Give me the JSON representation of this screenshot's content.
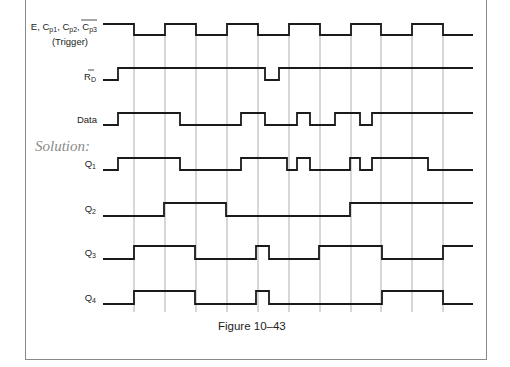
{
  "figure": {
    "caption": "Figure 10–43",
    "solution_label": "Solution:",
    "grid_lines_x": [
      134,
      165,
      196,
      227,
      258,
      289,
      320,
      351,
      381,
      412,
      443
    ],
    "x_start": 103,
    "x_end": 473
  },
  "signals": [
    {
      "name": "trigger",
      "label_line1": "E, C",
      "label_parts": [
        "E, C",
        "p1",
        ", C",
        "p2",
        ", C",
        "p3"
      ],
      "label_line2": "(Trigger)",
      "y_high": 24,
      "y_low": 35,
      "points": [
        [
          103,
          "H"
        ],
        [
          134,
          "L"
        ],
        [
          165,
          "H"
        ],
        [
          196,
          "L"
        ],
        [
          227,
          "H"
        ],
        [
          258,
          "L"
        ],
        [
          289,
          "H"
        ],
        [
          320,
          "L"
        ],
        [
          351,
          "H"
        ],
        [
          381,
          "L"
        ],
        [
          412,
          "H"
        ],
        [
          443,
          "L"
        ],
        [
          473,
          "L"
        ]
      ]
    },
    {
      "name": "reset",
      "label": "R",
      "label_sub": "D",
      "y_high": 68,
      "y_low": 80,
      "points": [
        [
          103,
          "L"
        ],
        [
          118,
          "H"
        ],
        [
          265,
          "L"
        ],
        [
          279,
          "H"
        ],
        [
          473,
          "H"
        ]
      ]
    },
    {
      "name": "data",
      "label": "Data",
      "y_high": 113,
      "y_low": 125,
      "points": [
        [
          103,
          "L"
        ],
        [
          118,
          "H"
        ],
        [
          180,
          "L"
        ],
        [
          241,
          "H"
        ],
        [
          265,
          "L"
        ],
        [
          297,
          "H"
        ],
        [
          310,
          "L"
        ],
        [
          335,
          "H"
        ],
        [
          360,
          "L"
        ],
        [
          372,
          "H"
        ],
        [
          473,
          "H"
        ]
      ]
    },
    {
      "name": "q1",
      "label": "Q",
      "label_sub": "1",
      "y_high": 158,
      "y_low": 170,
      "points": [
        [
          103,
          "L"
        ],
        [
          118,
          "H"
        ],
        [
          180,
          "L"
        ],
        [
          241,
          "H"
        ],
        [
          287,
          "L"
        ],
        [
          297,
          "H"
        ],
        [
          310,
          "L"
        ],
        [
          350,
          "H"
        ],
        [
          360,
          "L"
        ],
        [
          372,
          "H"
        ],
        [
          428,
          "L"
        ],
        [
          473,
          "L"
        ]
      ]
    },
    {
      "name": "q2",
      "label": "Q",
      "label_sub": "2",
      "y_high": 203,
      "y_low": 216,
      "points": [
        [
          103,
          "L"
        ],
        [
          164,
          "H"
        ],
        [
          226,
          "L"
        ],
        [
          350,
          "H"
        ],
        [
          473,
          "H"
        ]
      ]
    },
    {
      "name": "q3",
      "label": "Q",
      "label_sub": "3",
      "y_high": 246,
      "y_low": 259,
      "points": [
        [
          103,
          "L"
        ],
        [
          134,
          "H"
        ],
        [
          195,
          "L"
        ],
        [
          256,
          "H"
        ],
        [
          269,
          "L"
        ],
        [
          319,
          "H"
        ],
        [
          382,
          "L"
        ],
        [
          443,
          "H"
        ],
        [
          473,
          "H"
        ]
      ]
    },
    {
      "name": "q4",
      "label": "Q",
      "label_sub": "4",
      "y_high": 291,
      "y_low": 304,
      "points": [
        [
          103,
          "L"
        ],
        [
          134,
          "H"
        ],
        [
          195,
          "L"
        ],
        [
          256,
          "H"
        ],
        [
          269,
          "L"
        ],
        [
          382,
          "H"
        ],
        [
          443,
          "L"
        ],
        [
          473,
          "L"
        ]
      ]
    }
  ]
}
